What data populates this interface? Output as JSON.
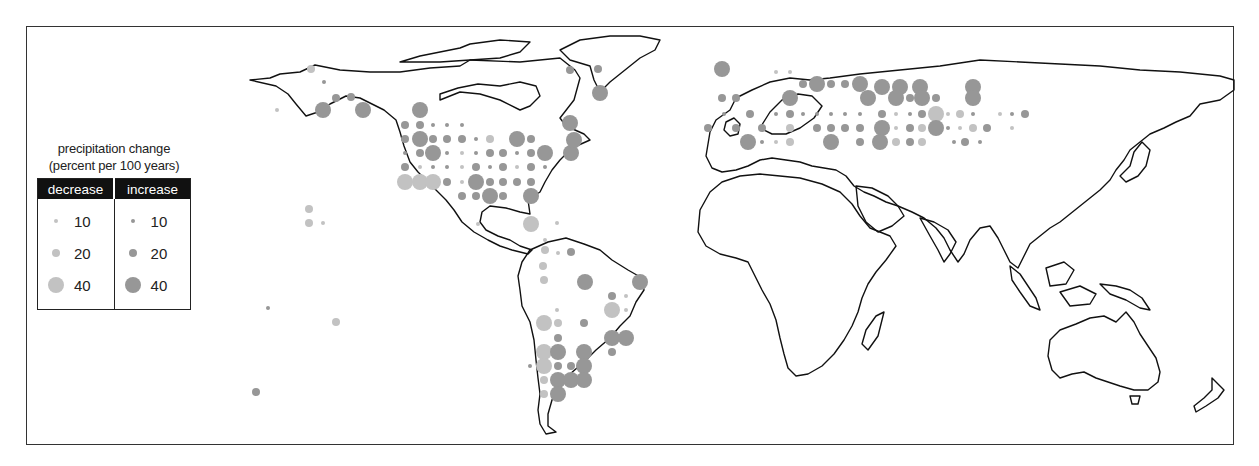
{
  "legend": {
    "title_line1": "precipitation change",
    "title_line2": "(percent per 100 years)",
    "columns": [
      {
        "label": "decrease",
        "color": "#c2c2c2",
        "entries": [
          {
            "value": "10",
            "r": 2
          },
          {
            "value": "20",
            "r": 4
          },
          {
            "value": "40",
            "r": 8
          }
        ]
      },
      {
        "label": "increase",
        "color": "#979797",
        "entries": [
          {
            "value": "10",
            "r": 2
          },
          {
            "value": "20",
            "r": 4
          },
          {
            "value": "40",
            "r": 8
          }
        ]
      }
    ]
  },
  "colors": {
    "decrease": "#c2c2c2",
    "increase": "#979797",
    "coastline": "#111111",
    "frame": "#333333"
  },
  "chart_data": {
    "type": "scatter",
    "title": "precipitation change (percent per 100 years)",
    "legend_position": "left",
    "size_scale": {
      "10": 2,
      "20": 4,
      "40": 8
    },
    "points": [
      {
        "x": 311,
        "y": 69,
        "c": "d",
        "m": 20
      },
      {
        "x": 324,
        "y": 82,
        "c": "i",
        "m": 10
      },
      {
        "x": 336,
        "y": 98,
        "c": "i",
        "m": 20
      },
      {
        "x": 351,
        "y": 97,
        "c": "i",
        "m": 20
      },
      {
        "x": 323,
        "y": 110,
        "c": "i",
        "m": 40
      },
      {
        "x": 363,
        "y": 110,
        "c": "i",
        "m": 40
      },
      {
        "x": 277,
        "y": 110,
        "c": "d",
        "m": 10
      },
      {
        "x": 420,
        "y": 110,
        "c": "i",
        "m": 40
      },
      {
        "x": 405,
        "y": 125,
        "c": "i",
        "m": 20
      },
      {
        "x": 420,
        "y": 125,
        "c": "i",
        "m": 20
      },
      {
        "x": 433,
        "y": 125,
        "c": "i",
        "m": 10
      },
      {
        "x": 447,
        "y": 125,
        "c": "i",
        "m": 10
      },
      {
        "x": 462,
        "y": 125,
        "c": "i",
        "m": 10
      },
      {
        "x": 405,
        "y": 139,
        "c": "i",
        "m": 20
      },
      {
        "x": 420,
        "y": 139,
        "c": "i",
        "m": 40
      },
      {
        "x": 433,
        "y": 139,
        "c": "i",
        "m": 20
      },
      {
        "x": 447,
        "y": 139,
        "c": "i",
        "m": 20
      },
      {
        "x": 462,
        "y": 139,
        "c": "i",
        "m": 20
      },
      {
        "x": 476,
        "y": 139,
        "c": "i",
        "m": 10
      },
      {
        "x": 490,
        "y": 139,
        "c": "d",
        "m": 20
      },
      {
        "x": 517,
        "y": 139,
        "c": "i",
        "m": 40
      },
      {
        "x": 531,
        "y": 139,
        "c": "i",
        "m": 20
      },
      {
        "x": 405,
        "y": 153,
        "c": "i",
        "m": 10
      },
      {
        "x": 420,
        "y": 153,
        "c": "i",
        "m": 20
      },
      {
        "x": 433,
        "y": 153,
        "c": "i",
        "m": 40
      },
      {
        "x": 447,
        "y": 153,
        "c": "i",
        "m": 10
      },
      {
        "x": 462,
        "y": 153,
        "c": "d",
        "m": 10
      },
      {
        "x": 476,
        "y": 153,
        "c": "i",
        "m": 10
      },
      {
        "x": 490,
        "y": 153,
        "c": "i",
        "m": 20
      },
      {
        "x": 503,
        "y": 153,
        "c": "i",
        "m": 20
      },
      {
        "x": 517,
        "y": 153,
        "c": "i",
        "m": 10
      },
      {
        "x": 531,
        "y": 153,
        "c": "i",
        "m": 20
      },
      {
        "x": 545,
        "y": 153,
        "c": "i",
        "m": 40
      },
      {
        "x": 571,
        "y": 153,
        "c": "i",
        "m": 40
      },
      {
        "x": 405,
        "y": 167,
        "c": "i",
        "m": 20
      },
      {
        "x": 420,
        "y": 167,
        "c": "d",
        "m": 10
      },
      {
        "x": 433,
        "y": 167,
        "c": "i",
        "m": 10
      },
      {
        "x": 447,
        "y": 167,
        "c": "i",
        "m": 10
      },
      {
        "x": 462,
        "y": 167,
        "c": "d",
        "m": 10
      },
      {
        "x": 476,
        "y": 167,
        "c": "i",
        "m": 20
      },
      {
        "x": 490,
        "y": 167,
        "c": "i",
        "m": 10
      },
      {
        "x": 503,
        "y": 167,
        "c": "i",
        "m": 20
      },
      {
        "x": 517,
        "y": 167,
        "c": "d",
        "m": 10
      },
      {
        "x": 531,
        "y": 167,
        "c": "i",
        "m": 20
      },
      {
        "x": 545,
        "y": 167,
        "c": "i",
        "m": 10
      },
      {
        "x": 405,
        "y": 182,
        "c": "d",
        "m": 40
      },
      {
        "x": 420,
        "y": 182,
        "c": "d",
        "m": 40
      },
      {
        "x": 433,
        "y": 182,
        "c": "d",
        "m": 40
      },
      {
        "x": 447,
        "y": 182,
        "c": "i",
        "m": 20
      },
      {
        "x": 462,
        "y": 182,
        "c": "d",
        "m": 10
      },
      {
        "x": 476,
        "y": 182,
        "c": "i",
        "m": 40
      },
      {
        "x": 490,
        "y": 182,
        "c": "i",
        "m": 20
      },
      {
        "x": 503,
        "y": 182,
        "c": "i",
        "m": 20
      },
      {
        "x": 517,
        "y": 182,
        "c": "i",
        "m": 20
      },
      {
        "x": 531,
        "y": 182,
        "c": "i",
        "m": 20
      },
      {
        "x": 462,
        "y": 196,
        "c": "i",
        "m": 20
      },
      {
        "x": 476,
        "y": 196,
        "c": "i",
        "m": 20
      },
      {
        "x": 490,
        "y": 196,
        "c": "i",
        "m": 40
      },
      {
        "x": 503,
        "y": 196,
        "c": "i",
        "m": 20
      },
      {
        "x": 531,
        "y": 196,
        "c": "i",
        "m": 40
      },
      {
        "x": 570,
        "y": 70,
        "c": "i",
        "m": 20
      },
      {
        "x": 598,
        "y": 69,
        "c": "i",
        "m": 20
      },
      {
        "x": 600,
        "y": 93,
        "c": "i",
        "m": 40
      },
      {
        "x": 570,
        "y": 123,
        "c": "i",
        "m": 40
      },
      {
        "x": 574,
        "y": 140,
        "c": "i",
        "m": 40
      },
      {
        "x": 309,
        "y": 209,
        "c": "d",
        "m": 20
      },
      {
        "x": 309,
        "y": 223,
        "c": "d",
        "m": 20
      },
      {
        "x": 323,
        "y": 223,
        "c": "d",
        "m": 10
      },
      {
        "x": 531,
        "y": 224,
        "c": "d",
        "m": 40
      },
      {
        "x": 557,
        "y": 223,
        "c": "d",
        "m": 10
      },
      {
        "x": 545,
        "y": 240,
        "c": "d",
        "m": 10
      },
      {
        "x": 478,
        "y": 224,
        "c": "d",
        "m": 10
      },
      {
        "x": 545,
        "y": 250,
        "c": "d",
        "m": 20
      },
      {
        "x": 558,
        "y": 253,
        "c": "d",
        "m": 10
      },
      {
        "x": 543,
        "y": 266,
        "c": "d",
        "m": 20
      },
      {
        "x": 571,
        "y": 252,
        "c": "i",
        "m": 20
      },
      {
        "x": 544,
        "y": 280,
        "c": "d",
        "m": 20
      },
      {
        "x": 585,
        "y": 282,
        "c": "i",
        "m": 40
      },
      {
        "x": 640,
        "y": 282,
        "c": "i",
        "m": 40
      },
      {
        "x": 612,
        "y": 296,
        "c": "i",
        "m": 20
      },
      {
        "x": 626,
        "y": 296,
        "c": "d",
        "m": 10
      },
      {
        "x": 612,
        "y": 310,
        "c": "d",
        "m": 40
      },
      {
        "x": 626,
        "y": 310,
        "c": "d",
        "m": 10
      },
      {
        "x": 557,
        "y": 310,
        "c": "d",
        "m": 10
      },
      {
        "x": 544,
        "y": 323,
        "c": "d",
        "m": 40
      },
      {
        "x": 558,
        "y": 323,
        "c": "d",
        "m": 20
      },
      {
        "x": 584,
        "y": 323,
        "c": "i",
        "m": 20
      },
      {
        "x": 558,
        "y": 338,
        "c": "i",
        "m": 20
      },
      {
        "x": 612,
        "y": 338,
        "c": "i",
        "m": 40
      },
      {
        "x": 626,
        "y": 338,
        "c": "i",
        "m": 40
      },
      {
        "x": 544,
        "y": 352,
        "c": "d",
        "m": 40
      },
      {
        "x": 558,
        "y": 352,
        "c": "i",
        "m": 40
      },
      {
        "x": 584,
        "y": 352,
        "c": "i",
        "m": 40
      },
      {
        "x": 612,
        "y": 352,
        "c": "i",
        "m": 20
      },
      {
        "x": 530,
        "y": 366,
        "c": "i",
        "m": 10
      },
      {
        "x": 544,
        "y": 366,
        "c": "d",
        "m": 40
      },
      {
        "x": 558,
        "y": 366,
        "c": "i",
        "m": 20
      },
      {
        "x": 571,
        "y": 366,
        "c": "i",
        "m": 20
      },
      {
        "x": 584,
        "y": 366,
        "c": "i",
        "m": 40
      },
      {
        "x": 544,
        "y": 380,
        "c": "d",
        "m": 20
      },
      {
        "x": 558,
        "y": 380,
        "c": "i",
        "m": 40
      },
      {
        "x": 571,
        "y": 380,
        "c": "i",
        "m": 40
      },
      {
        "x": 584,
        "y": 380,
        "c": "i",
        "m": 40
      },
      {
        "x": 544,
        "y": 394,
        "c": "d",
        "m": 20
      },
      {
        "x": 558,
        "y": 394,
        "c": "i",
        "m": 40
      },
      {
        "x": 268,
        "y": 308,
        "c": "i",
        "m": 10
      },
      {
        "x": 336,
        "y": 322,
        "c": "d",
        "m": 20
      },
      {
        "x": 256,
        "y": 392,
        "c": "i",
        "m": 20
      },
      {
        "x": 722,
        "y": 69,
        "c": "i",
        "m": 40
      },
      {
        "x": 776,
        "y": 72,
        "c": "d",
        "m": 10
      },
      {
        "x": 790,
        "y": 72,
        "c": "d",
        "m": 10
      },
      {
        "x": 722,
        "y": 98,
        "c": "i",
        "m": 20
      },
      {
        "x": 736,
        "y": 98,
        "c": "i",
        "m": 20
      },
      {
        "x": 790,
        "y": 98,
        "c": "d",
        "m": 10
      },
      {
        "x": 803,
        "y": 84,
        "c": "i",
        "m": 20
      },
      {
        "x": 817,
        "y": 84,
        "c": "i",
        "m": 40
      },
      {
        "x": 831,
        "y": 84,
        "c": "i",
        "m": 20
      },
      {
        "x": 845,
        "y": 84,
        "c": "i",
        "m": 20
      },
      {
        "x": 860,
        "y": 84,
        "c": "i",
        "m": 40
      },
      {
        "x": 882,
        "y": 87,
        "c": "i",
        "m": 40
      },
      {
        "x": 900,
        "y": 87,
        "c": "i",
        "m": 40
      },
      {
        "x": 920,
        "y": 87,
        "c": "i",
        "m": 40
      },
      {
        "x": 973,
        "y": 87,
        "c": "i",
        "m": 40
      },
      {
        "x": 790,
        "y": 98,
        "c": "i",
        "m": 40
      },
      {
        "x": 868,
        "y": 98,
        "c": "i",
        "m": 40
      },
      {
        "x": 896,
        "y": 98,
        "c": "i",
        "m": 40
      },
      {
        "x": 910,
        "y": 98,
        "c": "i",
        "m": 20
      },
      {
        "x": 922,
        "y": 98,
        "c": "i",
        "m": 40
      },
      {
        "x": 936,
        "y": 98,
        "c": "i",
        "m": 20
      },
      {
        "x": 973,
        "y": 98,
        "c": "i",
        "m": 40
      },
      {
        "x": 724,
        "y": 114,
        "c": "i",
        "m": 10
      },
      {
        "x": 750,
        "y": 114,
        "c": "i",
        "m": 20
      },
      {
        "x": 776,
        "y": 114,
        "c": "i",
        "m": 10
      },
      {
        "x": 790,
        "y": 114,
        "c": "i",
        "m": 20
      },
      {
        "x": 803,
        "y": 114,
        "c": "i",
        "m": 10
      },
      {
        "x": 817,
        "y": 114,
        "c": "i",
        "m": 10
      },
      {
        "x": 831,
        "y": 114,
        "c": "i",
        "m": 10
      },
      {
        "x": 845,
        "y": 114,
        "c": "i",
        "m": 10
      },
      {
        "x": 860,
        "y": 114,
        "c": "i",
        "m": 10
      },
      {
        "x": 882,
        "y": 114,
        "c": "i",
        "m": 20
      },
      {
        "x": 896,
        "y": 114,
        "c": "d",
        "m": 10
      },
      {
        "x": 910,
        "y": 114,
        "c": "i",
        "m": 10
      },
      {
        "x": 922,
        "y": 114,
        "c": "i",
        "m": 20
      },
      {
        "x": 936,
        "y": 114,
        "c": "d",
        "m": 40
      },
      {
        "x": 948,
        "y": 114,
        "c": "d",
        "m": 10
      },
      {
        "x": 960,
        "y": 114,
        "c": "d",
        "m": 20
      },
      {
        "x": 973,
        "y": 114,
        "c": "i",
        "m": 10
      },
      {
        "x": 1000,
        "y": 114,
        "c": "d",
        "m": 10
      },
      {
        "x": 1012,
        "y": 114,
        "c": "i",
        "m": 10
      },
      {
        "x": 1025,
        "y": 114,
        "c": "i",
        "m": 20
      },
      {
        "x": 708,
        "y": 128,
        "c": "i",
        "m": 20
      },
      {
        "x": 736,
        "y": 128,
        "c": "i",
        "m": 20
      },
      {
        "x": 762,
        "y": 128,
        "c": "i",
        "m": 20
      },
      {
        "x": 790,
        "y": 128,
        "c": "d",
        "m": 20
      },
      {
        "x": 817,
        "y": 128,
        "c": "i",
        "m": 20
      },
      {
        "x": 831,
        "y": 128,
        "c": "i",
        "m": 20
      },
      {
        "x": 845,
        "y": 128,
        "c": "i",
        "m": 20
      },
      {
        "x": 860,
        "y": 128,
        "c": "i",
        "m": 20
      },
      {
        "x": 882,
        "y": 128,
        "c": "i",
        "m": 40
      },
      {
        "x": 896,
        "y": 128,
        "c": "d",
        "m": 10
      },
      {
        "x": 910,
        "y": 128,
        "c": "i",
        "m": 20
      },
      {
        "x": 922,
        "y": 128,
        "c": "d",
        "m": 20
      },
      {
        "x": 936,
        "y": 128,
        "c": "i",
        "m": 40
      },
      {
        "x": 948,
        "y": 128,
        "c": "i",
        "m": 10
      },
      {
        "x": 960,
        "y": 128,
        "c": "d",
        "m": 10
      },
      {
        "x": 973,
        "y": 128,
        "c": "d",
        "m": 20
      },
      {
        "x": 987,
        "y": 128,
        "c": "i",
        "m": 20
      },
      {
        "x": 1012,
        "y": 128,
        "c": "d",
        "m": 10
      },
      {
        "x": 748,
        "y": 142,
        "c": "i",
        "m": 40
      },
      {
        "x": 762,
        "y": 142,
        "c": "i",
        "m": 10
      },
      {
        "x": 776,
        "y": 142,
        "c": "d",
        "m": 10
      },
      {
        "x": 790,
        "y": 142,
        "c": "d",
        "m": 20
      },
      {
        "x": 831,
        "y": 142,
        "c": "i",
        "m": 40
      },
      {
        "x": 860,
        "y": 142,
        "c": "i",
        "m": 20
      },
      {
        "x": 880,
        "y": 142,
        "c": "i",
        "m": 40
      },
      {
        "x": 896,
        "y": 142,
        "c": "d",
        "m": 20
      },
      {
        "x": 910,
        "y": 142,
        "c": "i",
        "m": 20
      },
      {
        "x": 922,
        "y": 142,
        "c": "d",
        "m": 20
      },
      {
        "x": 954,
        "y": 142,
        "c": "i",
        "m": 10
      },
      {
        "x": 965,
        "y": 142,
        "c": "i",
        "m": 20
      },
      {
        "x": 980,
        "y": 142,
        "c": "i",
        "m": 10
      }
    ]
  }
}
